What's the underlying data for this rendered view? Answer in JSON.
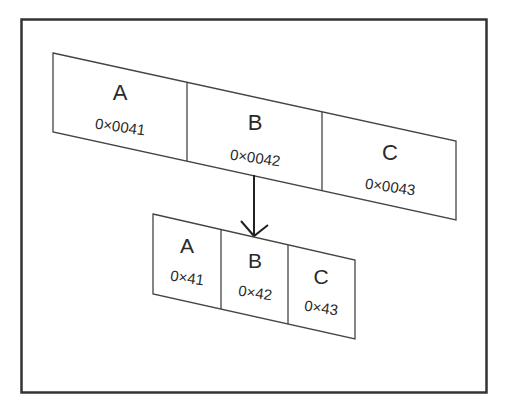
{
  "diagram": {
    "frame_color": "#333333",
    "line_color": "#444444",
    "text_color": "#2a2a2a",
    "wide_row": {
      "cells": [
        {
          "letter": "A",
          "value": "0×0041"
        },
        {
          "letter": "B",
          "value": "0×0042"
        },
        {
          "letter": "C",
          "value": "0×0043"
        }
      ]
    },
    "narrow_row": {
      "cells": [
        {
          "letter": "A",
          "value": "0×41"
        },
        {
          "letter": "B",
          "value": "0×42"
        },
        {
          "letter": "C",
          "value": "0×43"
        }
      ]
    },
    "arrow": {
      "from": "wide_row.B",
      "to": "narrow_row.B",
      "direction": "down"
    }
  }
}
